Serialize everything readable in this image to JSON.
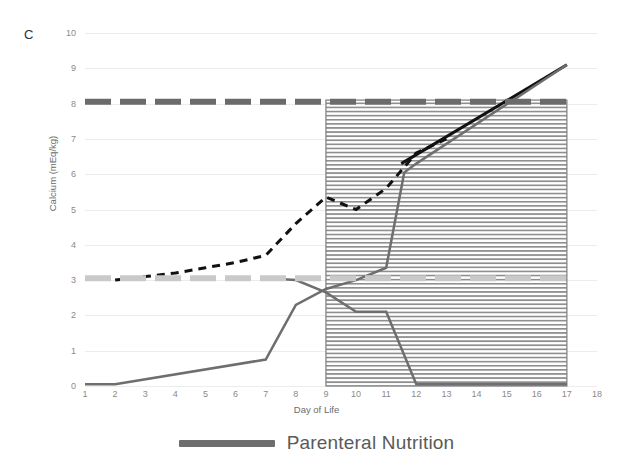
{
  "figure": {
    "panel_label": "C"
  },
  "axes": {
    "ylabel": "Calcium (mEq/kg)",
    "xlabel": "Day of Life",
    "yticks": [
      "0",
      "1",
      "2",
      "3",
      "4",
      "5",
      "6",
      "7",
      "8",
      "9",
      "10"
    ],
    "xticks": [
      "1",
      "2",
      "3",
      "4",
      "5",
      "6",
      "7",
      "8",
      "9",
      "10",
      "11",
      "12",
      "13",
      "14",
      "15",
      "16",
      "17",
      "18"
    ]
  },
  "legend": {
    "items": [
      {
        "label": "Parenteral Nutrition",
        "color": "#6e6e6e",
        "style": "solid-thick"
      }
    ]
  },
  "chart_data": {
    "type": "line",
    "title": "",
    "subtitle": "",
    "xlabel": "Day of Life",
    "ylabel": "Calcium (mEq/kg)",
    "xlim": [
      1,
      18
    ],
    "ylim": [
      0,
      10
    ],
    "xticks": [
      1,
      2,
      3,
      4,
      5,
      6,
      7,
      8,
      9,
      10,
      11,
      12,
      13,
      14,
      15,
      16,
      17,
      18
    ],
    "yticks": [
      0,
      1,
      2,
      3,
      4,
      5,
      6,
      7,
      8,
      9,
      10
    ],
    "grid": "horizontal",
    "legend_position": "bottom-center",
    "shaded_region": {
      "name": "hatched-region",
      "pattern": "horizontal-hatch",
      "x_range": [
        9,
        17
      ],
      "y_range": [
        0,
        8.1
      ],
      "color": "#9a9a9a"
    },
    "series": [
      {
        "name": "Total Calcium Intake",
        "style": "dashed",
        "color": "#111111",
        "width": 3,
        "x": [
          2,
          3,
          4,
          5,
          6,
          7,
          8,
          9,
          10,
          11,
          12,
          13
        ],
        "values": [
          3.0,
          3.1,
          3.2,
          3.35,
          3.5,
          3.7,
          4.6,
          5.35,
          5.0,
          5.6,
          6.6,
          7.0
        ]
      },
      {
        "name": "Enteral Calcium",
        "style": "solid",
        "color": "#111111",
        "width": 3,
        "x": [
          11.5,
          17
        ],
        "values": [
          6.3,
          9.1
        ]
      },
      {
        "name": "Parenteral Nutrition (rising)",
        "style": "solid",
        "color": "#6e6e6e",
        "width": 2.5,
        "x": [
          1,
          2,
          7,
          8,
          9,
          10,
          11,
          11.6,
          12,
          17
        ],
        "values": [
          0.05,
          0.05,
          0.75,
          2.3,
          2.75,
          3.0,
          3.35,
          6.05,
          6.3,
          9.1
        ]
      },
      {
        "name": "Parenteral Nutrition (falling)",
        "style": "solid",
        "color": "#6e6e6e",
        "width": 2.5,
        "x": [
          7,
          8,
          9,
          10,
          11,
          12,
          17
        ],
        "values": [
          3.05,
          3.0,
          2.65,
          2.1,
          2.1,
          0.05,
          0.05
        ]
      },
      {
        "name": "Upper Reference Limit",
        "style": "dashed-thick",
        "color": "#6b6b6b",
        "width": 6,
        "x": [
          1,
          17
        ],
        "values": [
          8.05,
          8.05
        ]
      },
      {
        "name": "Lower Reference Limit",
        "style": "dashed-thick",
        "color": "#c9c9c9",
        "width": 6,
        "x": [
          1,
          17
        ],
        "values": [
          3.05,
          3.05
        ]
      }
    ]
  }
}
